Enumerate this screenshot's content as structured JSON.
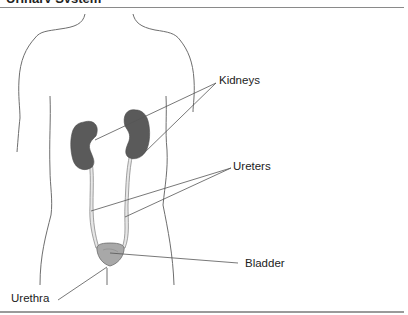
{
  "figure": {
    "title": "Urinary System",
    "labels": {
      "kidneys": "Kidneys",
      "ureters": "Ureters",
      "bladder": "Bladder",
      "urethra": "Urethra"
    },
    "colors": {
      "outline": "#6e6e6e",
      "kidney_fill": "#5a5a5a",
      "ureter_fill": "#e6e6e6",
      "bladder_fill": "#a8a8a8",
      "leader_line": "#555555",
      "rule": "#8a8a8a"
    }
  }
}
